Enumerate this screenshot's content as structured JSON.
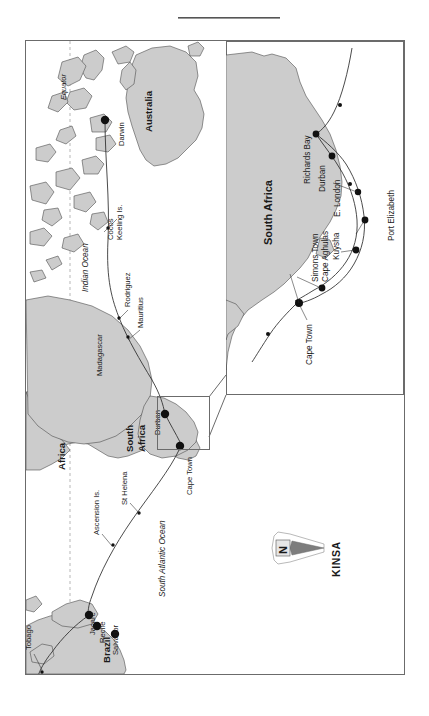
{
  "document": {
    "type": "route-map",
    "top_rule": true
  },
  "main_map": {
    "name": "world-voyage-map",
    "regions": [
      {
        "id": "australia",
        "label": "Australia",
        "style": "bold"
      },
      {
        "id": "africa",
        "label": "Africa",
        "style": "bold"
      },
      {
        "id": "south-africa",
        "label": "South Africa",
        "style": "bold"
      },
      {
        "id": "brazil",
        "label": "Brazil",
        "style": "bold"
      }
    ],
    "oceans": [
      {
        "id": "indian-ocean",
        "label": "Indian Ocean"
      },
      {
        "id": "south-atlantic-ocean",
        "label": "South Atlantic Ocean"
      }
    ],
    "reference_lines": [
      {
        "id": "equator",
        "label": "Equator",
        "style": "dashed"
      }
    ],
    "ports": [
      {
        "id": "darwin",
        "label": "Darwin",
        "marker": "large"
      },
      {
        "id": "durban",
        "label": "Durban",
        "marker": "large"
      },
      {
        "id": "cape-town",
        "label": "Cape Town",
        "marker": "large"
      },
      {
        "id": "jacare",
        "label": "Jacare",
        "marker": "large"
      },
      {
        "id": "recife",
        "label": "Recife",
        "marker": "large"
      },
      {
        "id": "salvador",
        "label": "Salvador",
        "marker": "large"
      }
    ],
    "waypoints": [
      {
        "id": "cocos-keeling-is",
        "label": "Cocos Keeling Is.",
        "marker": "small"
      },
      {
        "id": "rodriguez",
        "label": "Rodriguez",
        "marker": "small"
      },
      {
        "id": "mauritius",
        "label": "Mauritius",
        "marker": "small"
      },
      {
        "id": "madagascar",
        "label": "Madagascar",
        "marker": "none"
      },
      {
        "id": "ascension-is",
        "label": "Ascension Is.",
        "marker": "small"
      },
      {
        "id": "st-helena",
        "label": "St Helena",
        "marker": "small"
      },
      {
        "id": "tobago",
        "label": "Tobago",
        "marker": "small"
      }
    ]
  },
  "inset_map": {
    "name": "south-africa-detail-inset",
    "region_label": "South Africa",
    "ports": [
      {
        "id": "richards-bay",
        "label": "Richards Bay"
      },
      {
        "id": "durban",
        "label": "Durban"
      },
      {
        "id": "e-london",
        "label": "E. London"
      },
      {
        "id": "port-elizabeth",
        "label": "Port Elizabeth"
      },
      {
        "id": "kuysha",
        "label": "Kuysha"
      },
      {
        "id": "cape-aghulas",
        "label": "Cape Aghulas"
      },
      {
        "id": "simons-town",
        "label": "Simons Town"
      },
      {
        "id": "cape-town",
        "label": "Cape Town"
      }
    ]
  },
  "north_arrow": {
    "name": "north-arrow",
    "cardinal": "N",
    "brand": "KINSA"
  },
  "colors": {
    "land": "#cccccc",
    "coast": "#4d4d4d",
    "route": "#2b2b2b",
    "frame": "#6b6b6b",
    "text": "#1a1a1a",
    "background": "#ffffff"
  }
}
